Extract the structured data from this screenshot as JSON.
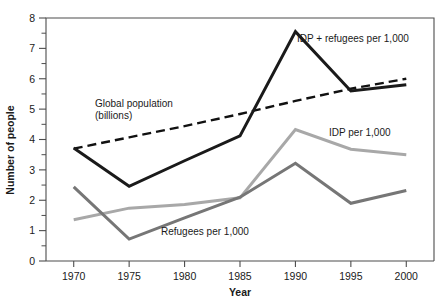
{
  "chart_data": {
    "type": "line",
    "title": "",
    "xlabel": "Year",
    "ylabel": "Number of people",
    "x": [
      1970,
      1975,
      1980,
      1985,
      1990,
      1995,
      2000
    ],
    "xlim": [
      1967.5,
      2002.5
    ],
    "ylim": [
      0,
      8
    ],
    "xticks": [
      "1970",
      "1975",
      "1980",
      "1985",
      "1990",
      "1995",
      "2000"
    ],
    "yticks": [
      "0",
      "1",
      "2",
      "3",
      "4",
      "5",
      "6",
      "7",
      "8"
    ],
    "yminor_step": 0.5,
    "grid": false,
    "legend_position": "inline-annotations",
    "series": [
      {
        "name": "IDP + refugees per 1,000",
        "label": "IDP + refugees per 1,000",
        "color": "#1a1a1a",
        "style": "solid",
        "width": 3,
        "values": [
          3.72,
          2.46,
          3.3,
          4.12,
          7.55,
          5.6,
          5.8
        ]
      },
      {
        "name": "Global population (billions)",
        "label": "Global population",
        "label_line2": "(billions)",
        "color": "#111111",
        "style": "dashed",
        "width": 2.4,
        "values": [
          3.7,
          4.07,
          4.44,
          4.84,
          5.27,
          5.67,
          6.0
        ]
      },
      {
        "name": "IDP per 1,000",
        "label": "IDP per 1,000",
        "color": "#a8a8a8",
        "style": "solid",
        "width": 3,
        "values": [
          1.36,
          1.74,
          1.86,
          2.08,
          4.33,
          3.68,
          3.5
        ]
      },
      {
        "name": "Refugees per 1,000",
        "label": "Refugees per 1,000",
        "color": "#767676",
        "style": "solid",
        "width": 3,
        "values": [
          2.44,
          0.72,
          1.42,
          2.1,
          3.22,
          1.9,
          2.32
        ]
      }
    ],
    "annotations": [
      {
        "id": "idp-refugees",
        "text": "IDP + refugees per 1,000",
        "x": 297,
        "y": 42
      },
      {
        "id": "global-population-l1",
        "text": "Global population",
        "x": 95,
        "y": 107
      },
      {
        "id": "global-population-l2",
        "text": "(billions)",
        "x": 95,
        "y": 119
      },
      {
        "id": "idp",
        "text": "IDP per 1,000",
        "x": 329,
        "y": 136
      },
      {
        "id": "refugees",
        "text": "Refugees per 1,000",
        "x": 161,
        "y": 235
      }
    ]
  },
  "colors": {
    "axis": "#4d4d4d",
    "text": "#1a1a1a",
    "idp_refugees": "#1a1a1a",
    "global_population": "#111111",
    "idp": "#a8a8a8",
    "refugees": "#767676",
    "background": "#ffffff"
  }
}
